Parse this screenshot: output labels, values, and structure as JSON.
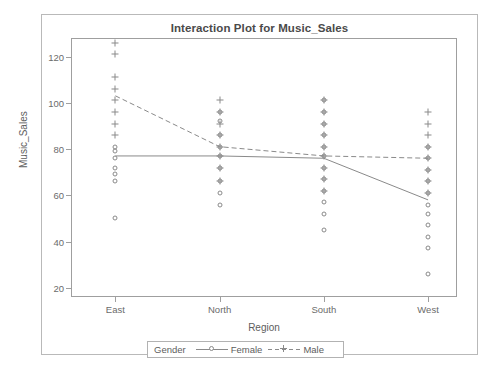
{
  "top_fragment": "",
  "chart_data": {
    "type": "scatter",
    "title": "Interaction Plot for Music_Sales",
    "xlabel": "Region",
    "ylabel": "Music_Sales",
    "categories": [
      "East",
      "North",
      "South",
      "West"
    ],
    "x_positions": [
      0.115,
      0.385,
      0.655,
      0.925
    ],
    "ylim": [
      16,
      128
    ],
    "yticks": [
      20,
      40,
      60,
      80,
      100,
      120
    ],
    "grid": false,
    "legend": {
      "title": "Gender",
      "position": "bottom-outside",
      "entries": [
        {
          "name": "Female",
          "marker": "circle",
          "line": "solid"
        },
        {
          "name": "Male",
          "marker": "plus",
          "line": "dashed"
        }
      ]
    },
    "series": [
      {
        "name": "Female",
        "marker": "circle",
        "line": "solid",
        "means": [
          77,
          77,
          76,
          58
        ],
        "points": [
          {
            "region": "East",
            "values": [
              81,
              79,
              76,
              72,
              69,
              66,
              50
            ]
          },
          {
            "region": "North",
            "values": [
              96,
              92,
              86,
              81,
              77,
              72,
              66,
              61,
              56
            ]
          },
          {
            "region": "South",
            "values": [
              101,
              96,
              91,
              86,
              81,
              77,
              72,
              67,
              62,
              57,
              52,
              45
            ]
          },
          {
            "region": "West",
            "values": [
              81,
              76,
              71,
              66,
              61,
              56,
              52,
              47,
              42,
              37,
              26
            ]
          }
        ]
      },
      {
        "name": "Male",
        "marker": "plus",
        "line": "dashed",
        "means": [
          103,
          81,
          77,
          76
        ],
        "points": [
          {
            "region": "East",
            "values": [
              126,
              121,
              111,
              106,
              101,
              96,
              91,
              86
            ]
          },
          {
            "region": "North",
            "values": [
              101,
              96,
              91,
              86,
              81,
              77,
              72,
              66
            ]
          },
          {
            "region": "South",
            "values": [
              101,
              96,
              91,
              86,
              81,
              77,
              72,
              67,
              62
            ]
          },
          {
            "region": "West",
            "values": [
              96,
              91,
              86,
              81,
              76,
              71,
              66,
              61
            ]
          }
        ]
      }
    ]
  }
}
